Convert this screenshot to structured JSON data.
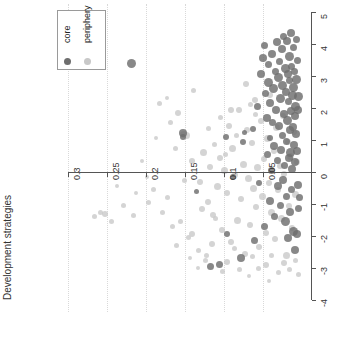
{
  "chart_data": {
    "type": "scatter",
    "title": "",
    "xlabel": "",
    "ylabel": "Development strategies",
    "xlim": [
      0.325,
      -0.012
    ],
    "ylim": [
      -4,
      5
    ],
    "x_reversed": true,
    "grid": "vertical-dotted",
    "x_ticks": [
      0.3,
      0.25,
      0.2,
      0.15,
      0.1,
      0.05
    ],
    "x_tick_labels": [
      "0.3",
      "0.25",
      "0.2",
      "0.15",
      "0.1",
      "0.05"
    ],
    "y_ticks": [
      5,
      4,
      3,
      2,
      1,
      0,
      -1,
      -2,
      -3,
      -4
    ],
    "y_tick_labels": [
      "5",
      "4",
      "3",
      "2",
      "1",
      "0",
      "-1",
      "-2",
      "-3",
      "-4"
    ],
    "y_axis_position": "right",
    "x_axis_position": "zero",
    "legend": {
      "position": "top-left",
      "entries": [
        {
          "name": "core",
          "color": "#6e6e6e"
        },
        {
          "name": "periphery",
          "color": "#c8c8c8"
        }
      ]
    },
    "series": [
      {
        "name": "core",
        "color": "#6e6e6e",
        "points": [
          [
            0.218,
            3.4,
            9
          ],
          [
            0.152,
            1.22,
            8
          ],
          [
            0.152,
            1.1,
            6
          ],
          [
            0.097,
            1.08,
            6
          ],
          [
            0.075,
            0.95,
            6
          ],
          [
            0.073,
            1.25,
            5
          ],
          [
            0.062,
            1.35,
            6
          ],
          [
            0.056,
            2.05,
            7
          ],
          [
            0.052,
            3.05,
            8
          ],
          [
            0.05,
            3.55,
            8
          ],
          [
            0.047,
            3.95,
            7
          ],
          [
            0.046,
            2.45,
            7
          ],
          [
            0.045,
            1.7,
            8
          ],
          [
            0.044,
            0.55,
            7
          ],
          [
            0.043,
            2.8,
            9
          ],
          [
            0.042,
            3.35,
            7
          ],
          [
            0.041,
            1.05,
            6
          ],
          [
            0.04,
            2.15,
            8
          ],
          [
            0.039,
            0.05,
            7
          ],
          [
            0.038,
            3.7,
            8
          ],
          [
            0.037,
            1.55,
            7
          ],
          [
            0.036,
            2.6,
            9
          ],
          [
            0.035,
            0.8,
            8
          ],
          [
            0.034,
            3.15,
            7
          ],
          [
            0.033,
            1.95,
            8
          ],
          [
            0.032,
            4.05,
            8
          ],
          [
            0.031,
            0.35,
            7
          ],
          [
            0.03,
            2.95,
            9
          ],
          [
            0.029,
            1.45,
            8
          ],
          [
            0.028,
            3.45,
            7
          ],
          [
            0.027,
            2.3,
            9
          ],
          [
            0.026,
            0.7,
            8
          ],
          [
            0.025,
            3.85,
            8
          ],
          [
            0.025,
            1.15,
            7
          ],
          [
            0.024,
            2.7,
            9
          ],
          [
            0.023,
            4.25,
            7
          ],
          [
            0.022,
            1.8,
            8
          ],
          [
            0.022,
            0.2,
            7
          ],
          [
            0.021,
            3.25,
            9
          ],
          [
            0.02,
            2.5,
            8
          ],
          [
            0.02,
            0.95,
            7
          ],
          [
            0.019,
            4.1,
            8
          ],
          [
            0.018,
            1.6,
            9
          ],
          [
            0.018,
            3.05,
            8
          ],
          [
            0.017,
            2.2,
            7
          ],
          [
            0.016,
            0.45,
            8
          ],
          [
            0.016,
            3.6,
            9
          ],
          [
            0.015,
            1.3,
            8
          ],
          [
            0.015,
            2.85,
            7
          ],
          [
            0.014,
            4.35,
            8
          ],
          [
            0.014,
            0.6,
            9
          ],
          [
            0.013,
            1.9,
            8
          ],
          [
            0.013,
            3.3,
            7
          ],
          [
            0.012,
            2.4,
            9
          ],
          [
            0.012,
            0.1,
            8
          ],
          [
            0.011,
            1.4,
            8
          ],
          [
            0.011,
            3.9,
            7
          ],
          [
            0.01,
            2.65,
            9
          ],
          [
            0.01,
            0.85,
            8
          ],
          [
            0.009,
            1.75,
            8
          ],
          [
            0.009,
            3.15,
            7
          ],
          [
            0.008,
            2.05,
            9
          ],
          [
            0.008,
            0.3,
            8
          ],
          [
            0.007,
            4.15,
            7
          ],
          [
            0.007,
            1.2,
            8
          ],
          [
            0.006,
            2.9,
            9
          ],
          [
            0.006,
            0.65,
            8
          ],
          [
            0.005,
            3.5,
            7
          ],
          [
            0.005,
            1.95,
            8
          ],
          [
            0.004,
            2.35,
            9
          ],
          [
            0.03,
            -0.45,
            8
          ],
          [
            0.027,
            -1.05,
            7
          ],
          [
            0.024,
            -0.25,
            8
          ],
          [
            0.021,
            -1.55,
            9
          ],
          [
            0.019,
            -0.75,
            7
          ],
          [
            0.017,
            -2.05,
            8
          ],
          [
            0.015,
            -1.25,
            8
          ],
          [
            0.013,
            -0.55,
            7
          ],
          [
            0.011,
            -1.85,
            9
          ],
          [
            0.009,
            -2.45,
            8
          ],
          [
            0.035,
            -1.4,
            7
          ],
          [
            0.04,
            -0.9,
            8
          ],
          [
            0.048,
            -1.7,
            7
          ],
          [
            0.055,
            -0.35,
            6
          ],
          [
            0.061,
            -2.15,
            7
          ],
          [
            0.078,
            -2.7,
            8
          ],
          [
            0.088,
            -0.15,
            6
          ],
          [
            0.096,
            -1.95,
            6
          ],
          [
            0.105,
            -2.9,
            7
          ],
          [
            0.117,
            -2.95,
            7
          ],
          [
            0.135,
            -0.6,
            5
          ],
          [
            0.005,
            -0.4,
            8
          ],
          [
            0.004,
            -1.15,
            7
          ],
          [
            0.006,
            -1.95,
            8
          ],
          [
            0.003,
            -0.8,
            7
          ]
        ]
      },
      {
        "name": "periphery",
        "color": "#c8c8c8",
        "points": [
          [
            0.158,
            1.85,
            6
          ],
          [
            0.148,
            1.15,
            7
          ],
          [
            0.141,
            0.35,
            6
          ],
          [
            0.138,
            2.55,
            5
          ],
          [
            0.13,
            -0.3,
            6
          ],
          [
            0.126,
            0.6,
            7
          ],
          [
            0.12,
            -0.95,
            6
          ],
          [
            0.118,
            0.15,
            6
          ],
          [
            0.113,
            -1.35,
            6
          ],
          [
            0.108,
            -0.45,
            7
          ],
          [
            0.105,
            0.45,
            6
          ],
          [
            0.102,
            -1.8,
            6
          ],
          [
            0.099,
            0.05,
            7
          ],
          [
            0.096,
            -0.65,
            6
          ],
          [
            0.093,
            1.45,
            6
          ],
          [
            0.09,
            -2.2,
            6
          ],
          [
            0.088,
            0.75,
            7
          ],
          [
            0.085,
            -0.1,
            6
          ],
          [
            0.082,
            -1.5,
            7
          ],
          [
            0.08,
            1.95,
            6
          ],
          [
            0.078,
            -0.85,
            6
          ],
          [
            0.075,
            0.25,
            7
          ],
          [
            0.073,
            -2.55,
            6
          ],
          [
            0.07,
            1.3,
            6
          ],
          [
            0.068,
            -0.2,
            7
          ],
          [
            0.066,
            -1.65,
            6
          ],
          [
            0.064,
            0.9,
            6
          ],
          [
            0.062,
            -0.5,
            7
          ],
          [
            0.06,
            2.25,
            6
          ],
          [
            0.058,
            -1.1,
            6
          ],
          [
            0.056,
            0.15,
            7
          ],
          [
            0.054,
            -2.35,
            6
          ],
          [
            0.052,
            1.6,
            6
          ],
          [
            0.05,
            -0.75,
            7
          ],
          [
            0.048,
            0.4,
            6
          ],
          [
            0.046,
            -1.9,
            6
          ],
          [
            0.044,
            1.05,
            7
          ],
          [
            0.042,
            -0.35,
            6
          ],
          [
            0.04,
            2.4,
            6
          ],
          [
            0.038,
            -1.25,
            7
          ],
          [
            0.036,
            0.65,
            6
          ],
          [
            0.034,
            -2.1,
            6
          ],
          [
            0.032,
            1.4,
            7
          ],
          [
            0.03,
            -0.55,
            6
          ],
          [
            0.028,
            0.2,
            6
          ],
          [
            0.026,
            -1.45,
            7
          ],
          [
            0.024,
            1.75,
            6
          ],
          [
            0.022,
            -0.05,
            6
          ],
          [
            0.02,
            -2.6,
            7
          ],
          [
            0.018,
            0.95,
            6
          ],
          [
            0.016,
            -1.05,
            6
          ],
          [
            0.014,
            0.5,
            7
          ],
          [
            0.012,
            -1.75,
            6
          ],
          [
            0.01,
            1.25,
            6
          ],
          [
            0.008,
            -0.7,
            7
          ],
          [
            0.006,
            0.3,
            6
          ],
          [
            0.19,
            -0.55,
            5
          ],
          [
            0.196,
            -0.95,
            5
          ],
          [
            0.178,
            -1.25,
            5
          ],
          [
            0.166,
            -1.7,
            5
          ],
          [
            0.172,
            -0.8,
            5
          ],
          [
            0.16,
            -2.3,
            5
          ],
          [
            0.155,
            -1.55,
            5
          ],
          [
            0.15,
            -0.25,
            5
          ],
          [
            0.145,
            -2.05,
            5
          ],
          [
            0.182,
            2.15,
            5
          ],
          [
            0.168,
            1.55,
            5
          ],
          [
            0.162,
            0.75,
            5
          ],
          [
            0.14,
            -1.95,
            6
          ],
          [
            0.132,
            -2.45,
            5
          ],
          [
            0.128,
            -1.15,
            6
          ],
          [
            0.123,
            -2.75,
            5
          ],
          [
            0.115,
            -2.25,
            6
          ],
          [
            0.11,
            -1.45,
            5
          ],
          [
            0.215,
            -1.35,
            5
          ],
          [
            0.228,
            -1.05,
            5
          ],
          [
            0.236,
            -0.45,
            4
          ],
          [
            0.243,
            -1.55,
            5
          ],
          [
            0.252,
            -1.3,
            6
          ],
          [
            0.258,
            -1.25,
            5
          ],
          [
            0.265,
            -1.4,
            5
          ],
          [
            0.152,
            1.18,
            7
          ],
          [
            0.173,
            2.3,
            4
          ],
          [
            0.186,
            1.05,
            4
          ],
          [
            0.205,
            0.35,
            4
          ],
          [
            0.198,
            -0.15,
            4
          ],
          [
            0.212,
            -0.65,
            4
          ],
          [
            0.09,
            1.95,
            6
          ],
          [
            0.083,
            1.15,
            5
          ],
          [
            0.098,
            0.55,
            5
          ],
          [
            0.104,
            1.7,
            5
          ],
          [
            0.112,
            0.85,
            5
          ],
          [
            0.119,
            1.35,
            5
          ],
          [
            0.071,
            2.75,
            6
          ],
          [
            0.065,
            2.1,
            5
          ],
          [
            0.059,
            1.8,
            5
          ],
          [
            0.095,
            -2.8,
            6
          ],
          [
            0.086,
            -2.4,
            5
          ],
          [
            0.079,
            -3.05,
            5
          ],
          [
            0.102,
            -3.1,
            5
          ],
          [
            0.122,
            -2.6,
            5
          ],
          [
            0.133,
            -3.0,
            4
          ],
          [
            0.143,
            -2.7,
            4
          ],
          [
            0.046,
            -2.9,
            6
          ],
          [
            0.038,
            -2.6,
            5
          ],
          [
            0.03,
            -3.15,
            5
          ],
          [
            0.022,
            -2.85,
            6
          ],
          [
            0.015,
            -3.05,
            5
          ],
          [
            0.008,
            -2.75,
            5
          ],
          [
            0.004,
            -3.2,
            5
          ],
          [
            0.055,
            -3.0,
            5
          ],
          [
            0.063,
            -2.65,
            5
          ],
          [
            0.068,
            -3.25,
            4
          ],
          [
            0.042,
            -3.4,
            4
          ]
        ]
      }
    ]
  },
  "legend": {
    "entries": [
      {
        "label": "core"
      },
      {
        "label": "periphery"
      }
    ]
  },
  "axis": {
    "y_title": "Development strategies"
  }
}
